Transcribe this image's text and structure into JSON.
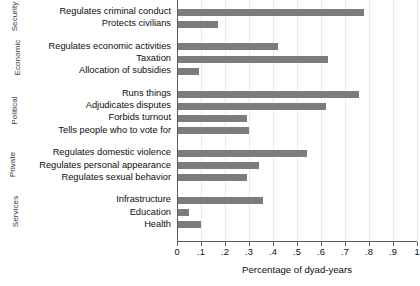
{
  "chart_data": {
    "type": "bar",
    "orientation": "horizontal",
    "title": "",
    "subtitle": "",
    "xlabel": "Percentage of dyad-years",
    "ylabel": "",
    "xlim": [
      0,
      1.0
    ],
    "xticks": [
      0,
      0.1,
      0.2,
      0.3,
      0.4,
      0.5,
      0.6,
      0.7,
      0.8,
      0.9,
      1.0
    ],
    "xticklabels": [
      "0",
      ".1",
      ".2",
      ".3",
      ".4",
      ".5",
      ".6",
      ".7",
      ".8",
      ".9",
      "1"
    ],
    "grid": "vertical-light",
    "legend": "none",
    "bar_color": "#7c7c7c",
    "groups": [
      {
        "name": "Security",
        "categories": [
          "Regulates criminal conduct",
          "Protects civilians"
        ],
        "values": [
          0.78,
          0.17
        ]
      },
      {
        "name": "Economic",
        "categories": [
          "Regulates economic activities",
          "Taxation",
          "Allocation of subsidies"
        ],
        "values": [
          0.42,
          0.63,
          0.09
        ]
      },
      {
        "name": "Political",
        "categories": [
          "Runs things",
          "Adjudicates disputes",
          "Forbids turnout",
          "Tells people who to vote for"
        ],
        "values": [
          0.76,
          0.62,
          0.29,
          0.3
        ]
      },
      {
        "name": "Private",
        "categories": [
          "Regulates domestic violence",
          "Regulates personal appearance",
          "Regulates sexual behavior"
        ],
        "values": [
          0.54,
          0.34,
          0.29
        ]
      },
      {
        "name": "Services",
        "categories": [
          "Infrastructure",
          "Education",
          "Health"
        ],
        "values": [
          0.36,
          0.05,
          0.1
        ]
      }
    ]
  }
}
